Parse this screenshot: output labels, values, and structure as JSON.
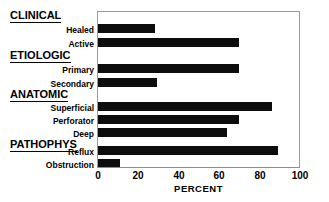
{
  "chart_data": {
    "type": "bar",
    "orientation": "horizontal",
    "title": "",
    "xlabel": "PERCENT",
    "ylabel": "",
    "xlim": [
      0,
      100
    ],
    "xticks": [
      0,
      20,
      40,
      60,
      80,
      100
    ],
    "grid": false,
    "legend": null,
    "bar_color": "#0d0d0d",
    "groups": [
      {
        "name": "CLINICAL",
        "categories": [
          "Healed",
          "Active"
        ],
        "values": [
          28,
          70
        ]
      },
      {
        "name": "ETIOLOGIC",
        "categories": [
          "Primary",
          "Secondary"
        ],
        "values": [
          70,
          29
        ]
      },
      {
        "name": "ANATOMIC",
        "categories": [
          "Superficial",
          "Perforator",
          "Deep"
        ],
        "values": [
          86,
          70,
          64
        ]
      },
      {
        "name": "PATHOPHYS",
        "categories": [
          "Reflux",
          "Obstruction"
        ],
        "values": [
          89,
          11
        ]
      }
    ],
    "categories": [
      "Healed",
      "Active",
      "Primary",
      "Secondary",
      "Superficial",
      "Perforator",
      "Deep",
      "Reflux",
      "Obstruction"
    ],
    "values": [
      28,
      70,
      70,
      29,
      86,
      70,
      64,
      89,
      11
    ]
  },
  "axis": {
    "x_title": "PERCENT",
    "tick_labels": [
      "0",
      "20",
      "40",
      "60",
      "80",
      "100"
    ]
  },
  "group_headers": [
    {
      "label": "CLINICAL"
    },
    {
      "label": "ETIOLOGIC"
    },
    {
      "label": "ANATOMIC"
    },
    {
      "label": "PATHOPHYS"
    }
  ],
  "row_labels": [
    {
      "label": "Healed"
    },
    {
      "label": "Active"
    },
    {
      "label": "Primary"
    },
    {
      "label": "Secondary"
    },
    {
      "label": "Superficial"
    },
    {
      "label": "Perforator"
    },
    {
      "label": "Deep"
    },
    {
      "label": "Reflux"
    },
    {
      "label": "Obstruction"
    }
  ]
}
